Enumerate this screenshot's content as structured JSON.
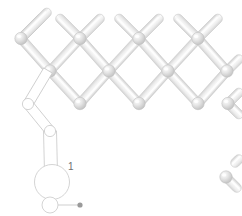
{
  "view": {
    "width": 242,
    "height": 216,
    "background": "#ffffff",
    "type": "3d-mechanism-render",
    "subject": "pantograph-scissor-lattice"
  },
  "style": {
    "link_fill_light": "#f6f6f6",
    "link_fill_mid": "#e2e2e2",
    "link_fill_dark": "#cfcfcf",
    "link_edge": "#c8c8c8",
    "node_fill_light": "#f4f4f4",
    "node_fill_mid": "#dedede",
    "node_fill_dark": "#c4c4c4",
    "node_edge": "#bfbfbf",
    "wire_stroke": "#c9c9c9",
    "wire_fill": "#ffffff",
    "marker_fill": "#9a9a9a",
    "label_color": "#6f6f6f"
  },
  "geometry": {
    "node_radius": 6.2,
    "link_half_width": 4.6,
    "row_pitch_x": 59,
    "row_offset_x": 29.5,
    "row_pitch_y": 32.5
  },
  "lattice": {
    "label": "scissor-lattice",
    "rows": [
      {
        "y": 38.5,
        "nodes": [
          21,
          80,
          139,
          198
        ]
      },
      {
        "y": 71.0,
        "nodes": [
          50,
          109,
          168,
          227
        ]
      },
      {
        "y": 103.5,
        "nodes": [
          80,
          139,
          198,
          228
        ]
      }
    ],
    "links": [
      {
        "x1": 21,
        "y1": 38.5,
        "x2": 44,
        "y2": 15.5
      },
      {
        "x1": 50,
        "y1": 71.0,
        "x2": 21,
        "y2": 38.5
      },
      {
        "x1": 21,
        "y1": 38.5,
        "x2": 50,
        "y2": 9.5
      },
      {
        "x1": 80,
        "y1": 38.5,
        "x2": 57,
        "y2": 15.5
      },
      {
        "x1": 80,
        "y1": 38.5,
        "x2": 103,
        "y2": 15.5
      },
      {
        "x1": 80,
        "y1": 38.5,
        "x2": 50,
        "y2": 71.0
      },
      {
        "x1": 80,
        "y1": 38.5,
        "x2": 109,
        "y2": 71.0
      },
      {
        "x1": 139,
        "y1": 38.5,
        "x2": 116,
        "y2": 15.5
      },
      {
        "x1": 139,
        "y1": 38.5,
        "x2": 162,
        "y2": 15.5
      },
      {
        "x1": 139,
        "y1": 38.5,
        "x2": 109,
        "y2": 71.0
      },
      {
        "x1": 139,
        "y1": 38.5,
        "x2": 168,
        "y2": 71.0
      },
      {
        "x1": 198,
        "y1": 38.5,
        "x2": 175,
        "y2": 15.5
      },
      {
        "x1": 198,
        "y1": 38.5,
        "x2": 221,
        "y2": 15.5
      },
      {
        "x1": 198,
        "y1": 38.5,
        "x2": 168,
        "y2": 71.0
      },
      {
        "x1": 198,
        "y1": 38.5,
        "x2": 227,
        "y2": 71.0
      },
      {
        "x1": 50,
        "y1": 71.0,
        "x2": 80,
        "y2": 103.5
      },
      {
        "x1": 109,
        "y1": 71.0,
        "x2": 80,
        "y2": 103.5
      },
      {
        "x1": 109,
        "y1": 71.0,
        "x2": 139,
        "y2": 103.5
      },
      {
        "x1": 168,
        "y1": 71.0,
        "x2": 139,
        "y2": 103.5
      },
      {
        "x1": 168,
        "y1": 71.0,
        "x2": 198,
        "y2": 103.5
      },
      {
        "x1": 227,
        "y1": 71.0,
        "x2": 198,
        "y2": 103.5
      },
      {
        "x1": 227,
        "y1": 71.0,
        "x2": 242,
        "y2": 56.0
      },
      {
        "x1": 228,
        "y1": 103.5,
        "x2": 242,
        "y2": 89.5
      },
      {
        "x1": 228,
        "y1": 103.5,
        "x2": 242,
        "y2": 117.5
      }
    ],
    "edge_fragments": [
      {
        "x1": 232,
        "y1": 166,
        "x2": 242,
        "y2": 156
      },
      {
        "x1": 226,
        "y1": 177,
        "x2": 240,
        "y2": 191
      }
    ],
    "edge_nodes": [
      {
        "x": 226,
        "y": 177
      }
    ]
  },
  "highlighted_assembly": {
    "label": "1",
    "label_x": 68,
    "label_y": 162,
    "render_mode": "wireframe",
    "links": [
      {
        "x1": 48,
        "y1": 70.5,
        "x2": 28,
        "y2": 104.0,
        "w": 5.0
      },
      {
        "x1": 28,
        "y1": 104.0,
        "x2": 50,
        "y2": 131.0,
        "w": 5.0
      },
      {
        "x1": 50,
        "y1": 131.0,
        "x2": 51,
        "y2": 172.0,
        "w": 6.5
      }
    ],
    "joints": [
      {
        "x": 28,
        "y": 104.0,
        "r": 5.6,
        "name": "pivot-upper"
      },
      {
        "x": 50,
        "y": 131.0,
        "r": 5.6,
        "name": "pivot-mid"
      },
      {
        "x": 52,
        "y": 182.0,
        "r": 17.5,
        "name": "disc-rotor"
      },
      {
        "x": 50,
        "y": 205.0,
        "r": 8.0,
        "name": "pivot-base"
      }
    ],
    "axis_marker": {
      "x1": 58,
      "y1": 205,
      "x2": 80,
      "y2": 205,
      "tip_x": 80,
      "tip_y": 205,
      "tip_r": 2.6
    }
  }
}
